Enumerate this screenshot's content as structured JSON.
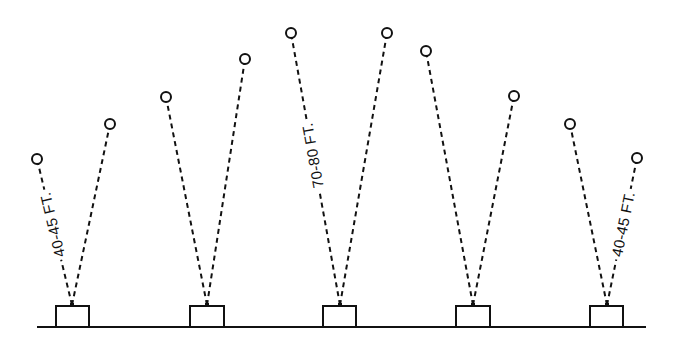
{
  "diagram": {
    "title": "",
    "ground": {
      "x1": 37,
      "x2": 646,
      "y": 327
    },
    "stations": [
      {
        "id": "station-1",
        "box": {
          "x": 56,
          "y": 306,
          "w": 33,
          "h": 21
        },
        "apex": [
          72,
          305
        ],
        "rays": [
          [
            37,
            159
          ],
          [
            110,
            124
          ]
        ]
      },
      {
        "id": "station-2",
        "box": {
          "x": 190,
          "y": 306,
          "w": 34,
          "h": 21
        },
        "apex": [
          207,
          305
        ],
        "rays": [
          [
            166,
            97
          ],
          [
            245,
            59
          ]
        ]
      },
      {
        "id": "station-3",
        "box": {
          "x": 323,
          "y": 306,
          "w": 33,
          "h": 21
        },
        "apex": [
          340,
          305
        ],
        "rays": [
          [
            291,
            33
          ],
          [
            387,
            33
          ]
        ]
      },
      {
        "id": "station-4",
        "box": {
          "x": 456,
          "y": 306,
          "w": 34,
          "h": 21
        },
        "apex": [
          473,
          305
        ],
        "rays": [
          [
            426,
            51
          ],
          [
            514,
            96
          ]
        ]
      },
      {
        "id": "station-5",
        "box": {
          "x": 590,
          "y": 306,
          "w": 33,
          "h": 21
        },
        "apex": [
          607,
          305
        ],
        "rays": [
          [
            570,
            124
          ],
          [
            637,
            158
          ]
        ]
      }
    ],
    "labels": [
      {
        "id": "label-left",
        "text": "40-45 FT.",
        "station": 1,
        "ray": 0
      },
      {
        "id": "label-center",
        "text": "70-80 FT.",
        "station": 3,
        "ray": 0
      },
      {
        "id": "label-right",
        "text": "40-45 FT.",
        "station": 5,
        "ray": 1
      }
    ]
  }
}
